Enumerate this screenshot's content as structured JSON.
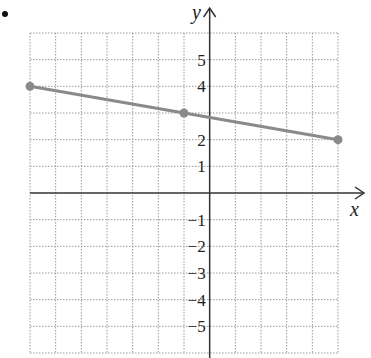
{
  "figure_label": "•",
  "chart_data": {
    "type": "line",
    "title": "",
    "xlabel": "x",
    "ylabel": "y",
    "xlim": [
      -7,
      5
    ],
    "ylim": [
      -6,
      6
    ],
    "grid": true,
    "y_tick_labels": [
      "5",
      "4",
      "2",
      "1",
      "−1",
      "−2",
      "−3",
      "−4",
      "−5"
    ],
    "y_tick_values": [
      5,
      4,
      2,
      1,
      -1,
      -2,
      -3,
      -4,
      -5
    ],
    "series": [
      {
        "name": "line",
        "color": "#8a8a8a",
        "points": [
          {
            "x": -7,
            "y": 4
          },
          {
            "x": -1,
            "y": 3
          },
          {
            "x": 5,
            "y": 2
          }
        ]
      }
    ]
  }
}
